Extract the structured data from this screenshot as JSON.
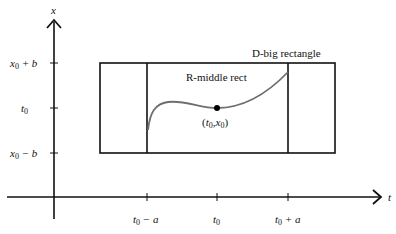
{
  "axes": {
    "x_label": "t",
    "y_label": "x"
  },
  "y_ticks": [
    {
      "label_main": "x",
      "label_sub": "0",
      "label_rest": " + b",
      "y": 63
    },
    {
      "label_main": "t",
      "label_sub": "0",
      "label_rest": "",
      "y": 108
    },
    {
      "label_main": "x",
      "label_sub": "0",
      "label_rest": " − b",
      "y": 153
    }
  ],
  "x_ticks": [
    {
      "label_main": "t",
      "label_sub": "0",
      "label_rest": " − a",
      "x": 147
    },
    {
      "label_main": "t",
      "label_sub": "0",
      "label_rest": "",
      "x": 217
    },
    {
      "label_main": "t",
      "label_sub": "0",
      "label_rest": " + a",
      "x": 288
    }
  ],
  "labels": {
    "big_rect": "D-big rectangle",
    "middle_rect": "R-middle rect",
    "point": "(t0, x0)",
    "point_t": "t",
    "point_t_sub": "0",
    "point_x": "x",
    "point_x_sub": "0"
  },
  "colors": {
    "axis": "#111111",
    "rect": "#111111",
    "curve": "#6e6e6e",
    "point": "#000000"
  }
}
